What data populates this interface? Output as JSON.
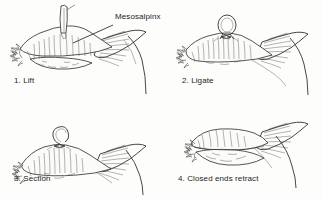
{
  "figure": {
    "background_color": "#fdfdfc",
    "ink_color": "#2b2b2b",
    "text_color": "#1d1d1d"
  },
  "annotations": [
    {
      "id": "mesosalpinx",
      "text": "Mesosalpinx",
      "x": 115,
      "y": 17,
      "leader_from_x": 113,
      "leader_from_y": 25,
      "leader_to_x": 73,
      "leader_to_y": 43
    }
  ],
  "panels": [
    {
      "id": "panel-lift",
      "number": "1.",
      "caption": "1. Lift",
      "step_name": "Lift",
      "caption_x": 14,
      "caption_y": 80,
      "origin_x": 8,
      "origin_y": 4,
      "has_clamp": true,
      "has_ligature_loop": false,
      "has_cut_tail": false,
      "ends_retracted": false
    },
    {
      "id": "panel-ligate",
      "number": "2.",
      "caption": "2. Ligate",
      "step_name": "Ligate",
      "caption_x": 182,
      "caption_y": 80,
      "origin_x": 178,
      "origin_y": 4,
      "has_clamp": false,
      "has_ligature_loop": true,
      "has_cut_tail": false,
      "ends_retracted": false
    },
    {
      "id": "panel-section",
      "number": "3.",
      "caption": "3. Section",
      "step_name": "Section",
      "caption_x": 14,
      "caption_y": 178,
      "origin_x": 8,
      "origin_y": 102,
      "has_clamp": false,
      "has_ligature_loop": false,
      "has_cut_tail": true,
      "ends_retracted": false
    },
    {
      "id": "panel-retract",
      "number": "4.",
      "caption": "4. Closed ends retract",
      "step_name": "Closed ends retract",
      "caption_x": 178,
      "caption_y": 178,
      "origin_x": 172,
      "origin_y": 102,
      "has_clamp": false,
      "has_ligature_loop": false,
      "has_cut_tail": false,
      "ends_retracted": true
    }
  ]
}
